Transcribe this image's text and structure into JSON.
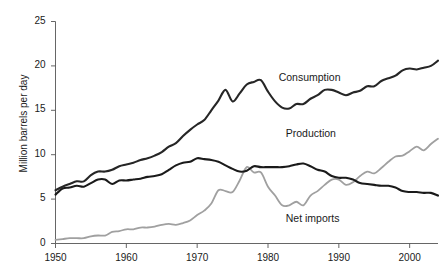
{
  "chart_data": {
    "type": "line",
    "title": "",
    "xlabel": "",
    "ylabel": "Million barrels per day",
    "xlim": [
      1950,
      2004
    ],
    "ylim": [
      0,
      25
    ],
    "grid": false,
    "legend_position": "inline-annotations",
    "xticks": [
      "1950",
      "1960",
      "1970",
      "1980",
      "1990",
      "2000"
    ],
    "xtick_values": [
      1950,
      1960,
      1970,
      1980,
      1990,
      2000
    ],
    "yticks": [
      "0",
      "5",
      "10",
      "15",
      "20",
      "25"
    ],
    "ytick_values": [
      0,
      5,
      10,
      15,
      20,
      25
    ],
    "x": [
      1950,
      1951,
      1952,
      1953,
      1954,
      1955,
      1956,
      1957,
      1958,
      1959,
      1960,
      1961,
      1962,
      1963,
      1964,
      1965,
      1966,
      1967,
      1968,
      1969,
      1970,
      1971,
      1972,
      1973,
      1974,
      1975,
      1976,
      1977,
      1978,
      1979,
      1980,
      1981,
      1982,
      1983,
      1984,
      1985,
      1986,
      1987,
      1988,
      1989,
      1990,
      1991,
      1992,
      1993,
      1994,
      1995,
      1996,
      1997,
      1998,
      1999,
      2000,
      2001,
      2002,
      2003,
      2004
    ],
    "series": [
      {
        "name": "Consumption",
        "color": "#262626",
        "width": 2.1,
        "label_x": 1981.5,
        "label_y": 18.6,
        "values": [
          6.0,
          6.4,
          6.7,
          7.0,
          7.0,
          7.7,
          8.1,
          8.1,
          8.3,
          8.7,
          8.9,
          9.1,
          9.4,
          9.6,
          9.9,
          10.3,
          10.9,
          11.3,
          12.1,
          12.8,
          13.4,
          13.9,
          15.0,
          16.1,
          17.3,
          16.0,
          16.9,
          17.9,
          18.2,
          18.4,
          17.1,
          16.0,
          15.3,
          15.2,
          15.7,
          15.7,
          16.3,
          16.7,
          17.3,
          17.3,
          17.0,
          16.7,
          17.0,
          17.2,
          17.7,
          17.7,
          18.3,
          18.6,
          18.9,
          19.5,
          19.7,
          19.6,
          19.8,
          20.0,
          20.6
        ]
      },
      {
        "name": "Production",
        "color": "#1a1a1a",
        "width": 2.1,
        "label_x": 1982.5,
        "label_y": 12.3,
        "values": [
          5.5,
          6.2,
          6.3,
          6.5,
          6.4,
          6.8,
          7.2,
          7.2,
          6.7,
          7.1,
          7.1,
          7.2,
          7.3,
          7.5,
          7.6,
          7.8,
          8.3,
          8.8,
          9.1,
          9.2,
          9.6,
          9.5,
          9.4,
          9.2,
          8.8,
          8.4,
          8.1,
          8.2,
          8.7,
          8.6,
          8.6,
          8.6,
          8.6,
          8.7,
          8.9,
          9.0,
          8.7,
          8.3,
          8.1,
          7.6,
          7.4,
          7.4,
          7.2,
          6.8,
          6.7,
          6.6,
          6.5,
          6.5,
          6.3,
          5.9,
          5.8,
          5.8,
          5.7,
          5.7,
          5.4
        ]
      },
      {
        "name": "Net imports",
        "color": "#a0a0a0",
        "width": 1.8,
        "label_x": 1982.5,
        "label_y": 2.8,
        "values": [
          0.4,
          0.5,
          0.6,
          0.6,
          0.6,
          0.8,
          0.9,
          0.9,
          1.3,
          1.4,
          1.6,
          1.6,
          1.8,
          1.8,
          1.9,
          2.1,
          2.2,
          2.1,
          2.3,
          2.6,
          3.2,
          3.7,
          4.5,
          6.0,
          5.9,
          5.8,
          7.1,
          8.6,
          8.0,
          8.0,
          6.4,
          5.4,
          4.3,
          4.3,
          4.7,
          4.3,
          5.4,
          5.9,
          6.6,
          7.2,
          7.2,
          6.6,
          6.9,
          7.6,
          8.1,
          7.9,
          8.5,
          9.2,
          9.8,
          9.9,
          10.4,
          10.9,
          10.5,
          11.2,
          11.8
        ]
      }
    ]
  },
  "axis": {
    "ylabel_text": "Million barrels per day"
  }
}
